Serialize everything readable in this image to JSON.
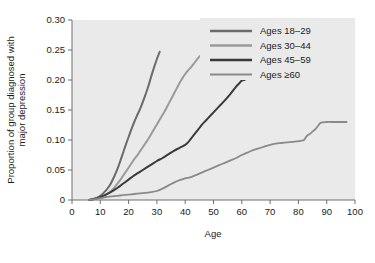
{
  "chart_data": {
    "type": "line",
    "title": "",
    "xlabel": "Age",
    "ylabel": "Proportion of group diagnosed with major depression",
    "xlim": [
      0,
      100
    ],
    "ylim": [
      0,
      0.3
    ],
    "xticks": [
      "0",
      "10",
      "20",
      "30",
      "40",
      "50",
      "60",
      "70",
      "80",
      "90",
      "100"
    ],
    "xtick_values": [
      0,
      10,
      20,
      30,
      40,
      50,
      60,
      70,
      80,
      90,
      100
    ],
    "yticks": [
      "0",
      "0.05",
      "0.10",
      "0.15",
      "0.20",
      "0.25",
      "0.30"
    ],
    "ytick_values": [
      0,
      0.05,
      0.1,
      0.15,
      0.2,
      0.25,
      0.3
    ],
    "grid": false,
    "legend_position": "top-right",
    "plot_background": "#eaeaea",
    "series": [
      {
        "name": "Ages 18–29",
        "color": "#6b6b6b",
        "width": 2.0,
        "x": [
          6,
          8,
          9,
          10,
          11,
          12,
          13,
          14,
          15,
          16,
          17,
          18,
          19,
          20,
          21,
          22,
          23,
          24,
          25,
          26,
          27,
          28,
          29,
          30,
          31
        ],
        "y": [
          0.0,
          0.002,
          0.004,
          0.007,
          0.011,
          0.016,
          0.022,
          0.03,
          0.04,
          0.051,
          0.064,
          0.078,
          0.092,
          0.105,
          0.118,
          0.13,
          0.141,
          0.151,
          0.163,
          0.176,
          0.19,
          0.206,
          0.221,
          0.235,
          0.247
        ]
      },
      {
        "name": "Ages 30–44",
        "color": "#9a9a9a",
        "width": 2.0,
        "x": [
          6,
          8,
          10,
          12,
          13,
          14,
          15,
          16,
          17,
          18,
          19,
          20,
          21,
          22,
          23,
          24,
          25,
          26,
          27,
          28,
          29,
          30,
          31,
          32,
          33,
          34,
          35,
          36,
          37,
          38,
          39,
          40,
          41,
          42,
          43,
          44,
          45,
          46
        ],
        "y": [
          0.0,
          0.002,
          0.005,
          0.009,
          0.012,
          0.016,
          0.021,
          0.027,
          0.033,
          0.04,
          0.047,
          0.054,
          0.061,
          0.068,
          0.074,
          0.081,
          0.088,
          0.095,
          0.102,
          0.11,
          0.118,
          0.126,
          0.134,
          0.142,
          0.15,
          0.159,
          0.168,
          0.177,
          0.186,
          0.195,
          0.203,
          0.21,
          0.216,
          0.221,
          0.227,
          0.233,
          0.239,
          0.242
        ]
      },
      {
        "name": "Ages 45–59",
        "color": "#3a3a3a",
        "width": 2.0,
        "x": [
          6,
          8,
          10,
          12,
          14,
          16,
          18,
          20,
          22,
          24,
          26,
          28,
          30,
          32,
          34,
          36,
          38,
          40,
          41,
          42,
          43,
          44,
          45,
          46,
          47,
          48,
          50,
          52,
          54,
          56,
          58,
          59,
          60,
          61
        ],
        "y": [
          0.0,
          0.002,
          0.005,
          0.009,
          0.014,
          0.02,
          0.027,
          0.034,
          0.041,
          0.047,
          0.053,
          0.059,
          0.065,
          0.07,
          0.076,
          0.082,
          0.087,
          0.092,
          0.096,
          0.102,
          0.108,
          0.114,
          0.12,
          0.126,
          0.131,
          0.136,
          0.146,
          0.156,
          0.166,
          0.177,
          0.189,
          0.194,
          0.199,
          0.2
        ]
      },
      {
        "name": "Ages ≥60",
        "color": "#8a8a8a",
        "width": 1.8,
        "x": [
          6,
          10,
          12,
          14,
          16,
          18,
          20,
          22,
          24,
          26,
          28,
          30,
          32,
          34,
          36,
          38,
          40,
          41,
          42,
          44,
          46,
          48,
          50,
          52,
          54,
          56,
          58,
          60,
          62,
          64,
          66,
          68,
          70,
          72,
          74,
          76,
          78,
          80,
          81,
          82,
          83,
          84,
          85,
          86,
          87,
          88,
          90,
          93,
          97
        ],
        "y": [
          0.0,
          0.003,
          0.005,
          0.006,
          0.007,
          0.008,
          0.009,
          0.01,
          0.011,
          0.012,
          0.013,
          0.015,
          0.019,
          0.024,
          0.029,
          0.033,
          0.036,
          0.037,
          0.038,
          0.042,
          0.046,
          0.05,
          0.054,
          0.058,
          0.062,
          0.066,
          0.07,
          0.075,
          0.079,
          0.083,
          0.086,
          0.089,
          0.092,
          0.094,
          0.095,
          0.096,
          0.097,
          0.098,
          0.099,
          0.1,
          0.107,
          0.11,
          0.114,
          0.118,
          0.124,
          0.129,
          0.13,
          0.13,
          0.13
        ]
      }
    ]
  },
  "legend": {
    "entries": [
      {
        "label": "Ages 18–29"
      },
      {
        "label": "Ages 30–44"
      },
      {
        "label": "Ages 45–59"
      },
      {
        "label": "Ages ≥60"
      }
    ]
  },
  "axes": {
    "x_title": "Age",
    "y_title_line1": "Proportion of group diagnosed with",
    "y_title_line2": "major depression"
  }
}
